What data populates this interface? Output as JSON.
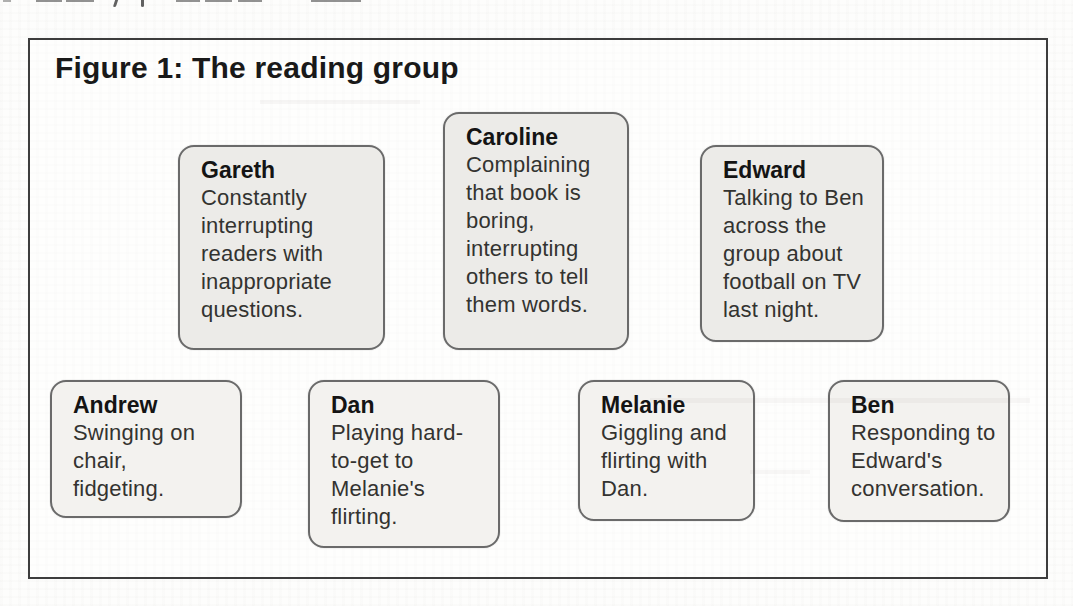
{
  "figure": {
    "title": "Figure 1: The reading group"
  },
  "boxes": [
    {
      "name": "Gareth",
      "description": "Constantly\ninterrupting\nreaders with\ninappropriate\nquestions."
    },
    {
      "name": "Caroline",
      "description": "Complaining\nthat book is\nboring,\ninterrupting\nothers to tell\nthem words."
    },
    {
      "name": "Edward",
      "description": "Talking to Ben\nacross the\ngroup about\nfootball on TV\nlast night."
    },
    {
      "name": "Andrew",
      "description": "Swinging on\nchair,\nfidgeting."
    },
    {
      "name": "Dan",
      "description": "Playing hard-\nto-get to\nMelanie's\nflirting."
    },
    {
      "name": "Melanie",
      "description": "Giggling and\nflirting with\nDan."
    },
    {
      "name": "Ben",
      "description": "Responding to\nEdward's\nconversation."
    }
  ],
  "colors": {
    "frame_border": "#3d3d3d",
    "box_border": "#6a6a6a",
    "box_fill_top_row": "#ecebe8",
    "box_fill_bottom_row": "#f3f2ef",
    "title_text": "#191919",
    "body_text": "#333330",
    "page_background": "#fdfdfc"
  }
}
